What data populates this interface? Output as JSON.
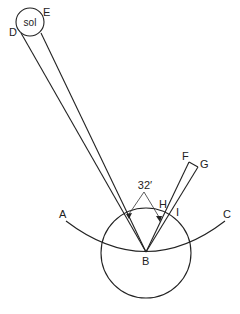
{
  "diagram": {
    "title": "",
    "labels": {
      "sun": "sol",
      "D": "D",
      "E": "E",
      "F": "F",
      "G": "G",
      "H": "H",
      "I": "I",
      "A": "A",
      "B": "B",
      "C": "C",
      "angle": "32′"
    },
    "colors": {
      "line": "#222222",
      "background": "#ffffff"
    },
    "geometry": {
      "sun": {
        "cx": 30,
        "cy": 22,
        "r": 14
      },
      "earth": {
        "cx": 146,
        "cy": 253,
        "r": 45
      },
      "observer_B": {
        "x": 146,
        "y": 252
      },
      "arc_AC": {
        "start": [
          66,
          221
        ],
        "end": [
          225,
          221
        ]
      }
    }
  }
}
